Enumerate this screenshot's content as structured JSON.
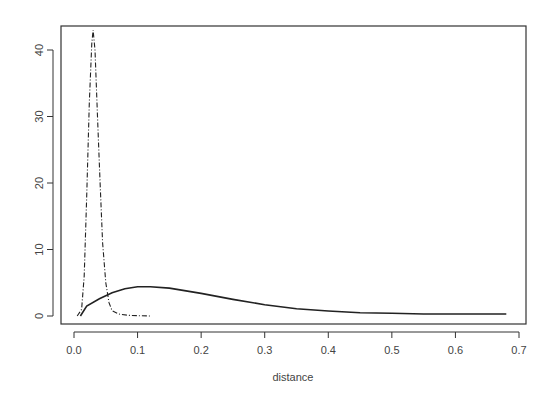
{
  "chart_data": {
    "type": "line",
    "title": "",
    "xlabel": "distance",
    "ylabel": "",
    "xlim": [
      0.0,
      0.7
    ],
    "ylim": [
      0,
      43
    ],
    "grid": false,
    "legend": null,
    "x_ticks": [
      "0.0",
      "0.1",
      "0.2",
      "0.3",
      "0.4",
      "0.5",
      "0.6",
      "0.7"
    ],
    "y_ticks": [
      "0",
      "10",
      "20",
      "30",
      "40"
    ],
    "series": [
      {
        "name": "solid",
        "style": "solid",
        "x": [
          0.01,
          0.02,
          0.04,
          0.06,
          0.08,
          0.1,
          0.12,
          0.15,
          0.2,
          0.25,
          0.3,
          0.35,
          0.4,
          0.45,
          0.5,
          0.55,
          0.6,
          0.65,
          0.68
        ],
        "y": [
          0.0,
          1.5,
          2.6,
          3.5,
          4.1,
          4.4,
          4.4,
          4.2,
          3.4,
          2.5,
          1.7,
          1.1,
          0.75,
          0.5,
          0.4,
          0.3,
          0.3,
          0.3,
          0.3
        ]
      },
      {
        "name": "dash-dot",
        "style": "dashdot",
        "x": [
          0.005,
          0.012,
          0.016,
          0.02,
          0.024,
          0.028,
          0.03,
          0.033,
          0.037,
          0.041,
          0.045,
          0.05,
          0.055,
          0.06,
          0.07,
          0.085,
          0.1,
          0.12
        ],
        "y": [
          0.0,
          1.0,
          6.0,
          18.0,
          32.0,
          41.0,
          43.0,
          40.0,
          30.0,
          20.0,
          11.0,
          5.0,
          2.0,
          0.8,
          0.3,
          0.1,
          0.05,
          0.0
        ]
      }
    ]
  }
}
